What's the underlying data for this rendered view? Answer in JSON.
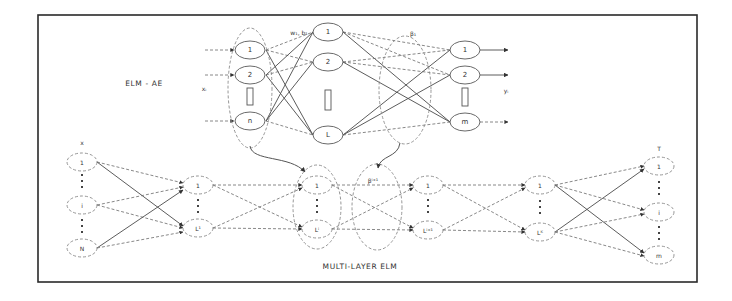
{
  "figure": {
    "top_title": "ELM - AE",
    "bottom_title": "MULTI-LAYER ELM"
  },
  "elm_ae": {
    "input_label": "xᵢ",
    "weights_label": "w₁, b₁",
    "beta_label": "β₁",
    "output_label": "yᵢ",
    "input_nodes": [
      "1",
      "2",
      "n"
    ],
    "hidden_nodes": [
      "1",
      "2",
      "L"
    ],
    "output_nodes": [
      "1",
      "2",
      "m"
    ]
  },
  "multilayer_elm": {
    "input_label": "x",
    "output_label": "T",
    "beta_label": "βⁱ⁺¹",
    "input_nodes": [
      "1",
      "i",
      "N"
    ],
    "layer1_nodes": [
      "1",
      "L¹"
    ],
    "layer2_nodes": [
      "1",
      "Lⁱ"
    ],
    "layer3_nodes": [
      "1",
      "Lⁱ⁺¹"
    ],
    "layer4_nodes": [
      "1",
      "Lᴷ"
    ],
    "output_nodes": [
      "1",
      "i",
      "m"
    ]
  }
}
